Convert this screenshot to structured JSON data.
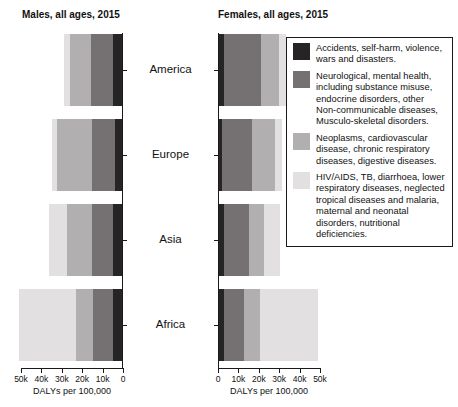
{
  "figure": {
    "regions": [
      "America",
      "Europe",
      "Asia",
      "Africa"
    ],
    "xlabel": "DALYs per 100,000",
    "background": "#ffffff",
    "axis_color": "#1a1a1a"
  },
  "legend": {
    "entries": [
      {
        "label": "Accidents, self-harm, violence, wars and disasters.",
        "color": "#272425"
      },
      {
        "label": "Neurological, mental health, including substance misuse, endocrine disorders, other Non-communicable diseases, Musculo-skeletal disorders.",
        "color": "#757172"
      },
      {
        "label": "Neoplasms, cardiovascular disease, chronic respiratory diseases, digestive diseases.",
        "color": "#b2afb0"
      },
      {
        "label": "HIV/AIDS, TB, diarrhoea, lower respiratory diseases, neglected tropical diseases and malaria, maternal and neonatal disorders, nutritional deficiencies.",
        "color": "#e2e0e0"
      }
    ]
  },
  "chart_data": [
    {
      "type": "bar",
      "orientation": "horizontal-stacked",
      "title": "Males, all ages, 2015",
      "categories": [
        "America",
        "Europe",
        "Asia",
        "Africa"
      ],
      "series": [
        {
          "name": "Accidents, self-harm, violence, wars and disasters.",
          "color": "#272425",
          "values": [
            4500,
            3500,
            4500,
            4500
          ]
        },
        {
          "name": "Neurological, mental health, including substance misuse, endocrine disorders, other Non-communicable diseases, Musculo-skeletal disorders.",
          "color": "#757172",
          "values": [
            10500,
            11000,
            10000,
            9500
          ]
        },
        {
          "name": "Neoplasms, cardiovascular disease, chronic respiratory diseases, digestive diseases.",
          "color": "#b2afb0",
          "values": [
            10500,
            17500,
            12500,
            8500
          ]
        },
        {
          "name": "HIV/AIDS, TB, diarrhoea, lower respiratory diseases, neglected tropical diseases and malaria, maternal and neonatal disorders, nutritional deficiencies.",
          "color": "#e2e0e0",
          "values": [
            3000,
            2500,
            9000,
            28000
          ]
        }
      ],
      "xlabel": "DALYs per 100,000",
      "xlim": [
        0,
        50000
      ],
      "tick_labels": [
        "50k",
        "40k",
        "30k",
        "20k",
        "10k",
        "0"
      ],
      "axis_reversed": true,
      "legend_position": "none"
    },
    {
      "type": "bar",
      "orientation": "horizontal-stacked",
      "title": "Females, all ages, 2015",
      "categories": [
        "America",
        "Europe",
        "Asia",
        "Africa"
      ],
      "series": [
        {
          "name": "Accidents, self-harm, violence, wars and disasters.",
          "color": "#272425",
          "values": [
            2500,
            1500,
            2500,
            2500
          ]
        },
        {
          "name": "Neurological, mental health, including substance misuse, endocrine disorders, other Non-communicable diseases, Musculo-skeletal disorders.",
          "color": "#757172",
          "values": [
            18000,
            14500,
            12000,
            10000
          ]
        },
        {
          "name": "Neoplasms, cardiovascular disease, chronic respiratory diseases, digestive diseases.",
          "color": "#b2afb0",
          "values": [
            9000,
            11500,
            7500,
            7500
          ]
        },
        {
          "name": "HIV/AIDS, TB, diarrhoea, lower respiratory diseases, neglected tropical diseases and malaria, maternal and neonatal disorders, nutritional deficiencies.",
          "color": "#e2e0e0",
          "values": [
            3500,
            3500,
            8000,
            28500
          ]
        }
      ],
      "xlabel": "DALYs per 100,000",
      "xlim": [
        0,
        50000
      ],
      "tick_labels": [
        "0",
        "10k",
        "20k",
        "30k",
        "40k",
        "50k"
      ],
      "axis_reversed": false,
      "legend_position": "right"
    }
  ]
}
